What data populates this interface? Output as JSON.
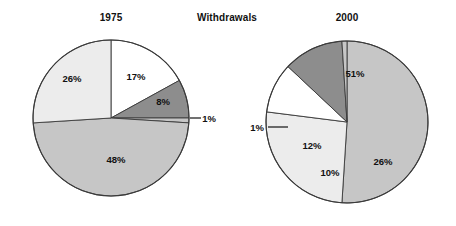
{
  "figure": {
    "center_title": "Withdrawals",
    "background": "#ffffff",
    "text_color": "#111111"
  },
  "palette": {
    "white": "#ffffff",
    "light_gray": "#ececec",
    "medium_gray": "#c6c6c6",
    "dark_gray": "#8d8d8d",
    "outline": "#3a3a3a"
  },
  "chart_data": [
    {
      "type": "pie",
      "title": "1975",
      "id": "pie-1975",
      "center": [
        111,
        118
      ],
      "radius": 78,
      "start_angle_deg": 0,
      "direction": "clockwise",
      "categories": [
        "17%",
        "8%",
        "1%",
        "48%",
        "26%"
      ],
      "values": [
        17,
        8,
        1,
        48,
        26
      ],
      "labels": [
        "17%",
        "8%",
        "1%",
        "48%",
        "26%"
      ],
      "colors": [
        "#ffffff",
        "#8d8d8d",
        "#c6c6c6",
        "#c6c6c6",
        "#ececec"
      ],
      "label_positions": [
        [
          136,
          76
        ],
        [
          163,
          101
        ],
        [
          209,
          118
        ],
        [
          116,
          159
        ],
        [
          72,
          78
        ]
      ],
      "leader_lines": [
        {
          "label": "1%",
          "from": [
            190,
            118
          ],
          "to": [
            201,
            118
          ]
        }
      ]
    },
    {
      "type": "pie",
      "title": "2000",
      "id": "pie-2000",
      "center": [
        347,
        122
      ],
      "radius": 81,
      "start_angle_deg": 0,
      "direction": "clockwise",
      "categories": [
        "51%",
        "26%",
        "10%",
        "12%",
        "1%"
      ],
      "values": [
        51,
        26,
        10,
        12,
        1
      ],
      "labels": [
        "51%",
        "26%",
        "10%",
        "12%",
        "1%"
      ],
      "colors": [
        "#c6c6c6",
        "#ececec",
        "#ffffff",
        "#8d8d8d",
        "#c6c6c6"
      ],
      "label_positions": [
        [
          355,
          73
        ],
        [
          383,
          161
        ],
        [
          330,
          172
        ],
        [
          312,
          145
        ]
      ],
      "outside_label": {
        "text": "1%",
        "position": [
          257,
          127
        ]
      },
      "leader_lines": [
        {
          "label": "1%",
          "from": [
            268,
            127
          ],
          "to": [
            288,
            127
          ]
        }
      ]
    }
  ]
}
